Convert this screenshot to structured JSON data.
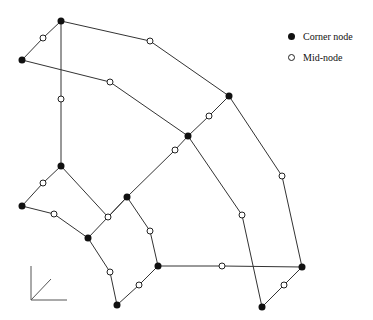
{
  "diagram": {
    "title": "",
    "type": "finite-element-mesh",
    "colors": {
      "line": "#333333",
      "corner_fill": "#111111",
      "mid_fill": "#ffffff"
    },
    "corner_nodes": [
      [
        61,
        21
      ],
      [
        22,
        60
      ],
      [
        229,
        96
      ],
      [
        188,
        136
      ],
      [
        61,
        166
      ],
      [
        22,
        206
      ],
      [
        127,
        197
      ],
      [
        88,
        238
      ],
      [
        158,
        266
      ],
      [
        117,
        305
      ],
      [
        302,
        267
      ],
      [
        262,
        307
      ]
    ],
    "mid_nodes": [
      [
        43,
        38
      ],
      [
        150,
        41
      ],
      [
        110,
        82
      ],
      [
        61,
        99
      ],
      [
        209,
        116
      ],
      [
        175,
        150
      ],
      [
        43,
        183
      ],
      [
        54,
        214
      ],
      [
        108,
        217
      ],
      [
        150,
        231
      ],
      [
        139,
        285
      ],
      [
        110,
        272
      ],
      [
        282,
        176
      ],
      [
        242,
        215
      ],
      [
        222,
        266
      ],
      [
        284,
        285
      ]
    ],
    "edges": [
      [
        [
          22,
          60
        ],
        [
          43,
          38
        ],
        [
          61,
          21
        ]
      ],
      [
        [
          61,
          21
        ],
        [
          150,
          41
        ],
        [
          229,
          96
        ]
      ],
      [
        [
          22,
          60
        ],
        [
          110,
          82
        ],
        [
          188,
          136
        ]
      ],
      [
        [
          61,
          21
        ],
        [
          61,
          99
        ],
        [
          61,
          166
        ]
      ],
      [
        [
          188,
          136
        ],
        [
          209,
          116
        ],
        [
          229,
          96
        ]
      ],
      [
        [
          127,
          197
        ],
        [
          175,
          150
        ],
        [
          188,
          136
        ]
      ],
      [
        [
          22,
          206
        ],
        [
          43,
          183
        ],
        [
          61,
          166
        ]
      ],
      [
        [
          61,
          166
        ],
        [
          108,
          217
        ],
        [
          127,
          197
        ]
      ],
      [
        [
          22,
          206
        ],
        [
          54,
          214
        ],
        [
          88,
          238
        ]
      ],
      [
        [
          88,
          238
        ],
        [
          108,
          217
        ],
        [
          127,
          197
        ]
      ],
      [
        [
          127,
          197
        ],
        [
          150,
          231
        ],
        [
          158,
          266
        ]
      ],
      [
        [
          88,
          238
        ],
        [
          110,
          272
        ],
        [
          117,
          305
        ]
      ],
      [
        [
          117,
          305
        ],
        [
          139,
          285
        ],
        [
          158,
          266
        ]
      ],
      [
        [
          229,
          96
        ],
        [
          282,
          176
        ],
        [
          302,
          267
        ]
      ],
      [
        [
          188,
          136
        ],
        [
          242,
          215
        ],
        [
          262,
          307
        ]
      ],
      [
        [
          158,
          266
        ],
        [
          222,
          266
        ],
        [
          302,
          267
        ]
      ],
      [
        [
          262,
          307
        ],
        [
          284,
          285
        ],
        [
          302,
          267
        ]
      ]
    ],
    "axes_glyph": {
      "origin": [
        31,
        300
      ],
      "x_end": [
        67,
        300
      ],
      "y_end": [
        31,
        266
      ],
      "z_end": [
        51,
        279
      ]
    }
  },
  "legend": {
    "items": [
      {
        "label": "Corner node",
        "symbol": "filled-circle"
      },
      {
        "label": "Mid-node",
        "symbol": "open-circle"
      }
    ]
  }
}
